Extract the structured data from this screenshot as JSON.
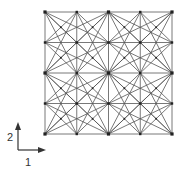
{
  "diagram": {
    "type": "truss-lattice",
    "grid": {
      "cells_x": 4,
      "cells_y": 4,
      "nodes_x": 5,
      "nodes_y": 5
    },
    "unit_block_cells": 2,
    "connections": [
      "orthogonal",
      "cell-diagonal",
      "knight-move (1,2)",
      "block-diagonal"
    ],
    "line_color": "#555555",
    "node_color": "#222222"
  },
  "axes": {
    "vertical_label": "2",
    "horizontal_label": "1",
    "color": "#333333"
  }
}
